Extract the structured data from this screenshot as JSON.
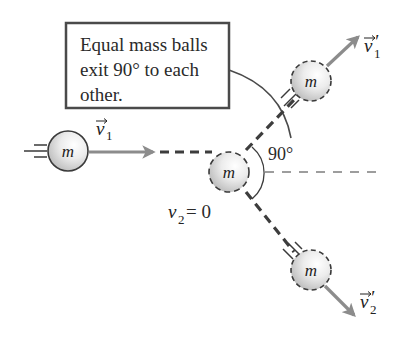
{
  "callout": {
    "lines": [
      "Equal mass balls",
      "exit 90° to each",
      "other."
    ]
  },
  "balls": {
    "incoming": {
      "label": "m"
    },
    "target": {
      "label": "m"
    },
    "exit_upper": {
      "label": "m"
    },
    "exit_lower": {
      "label": "m"
    }
  },
  "labels": {
    "v1_symbol": "v",
    "v1_sub": "1",
    "v1p_symbol": "v",
    "v1p_sub": "1",
    "v1p_prime": "′",
    "v2p_symbol": "v",
    "v2p_sub": "2",
    "v2p_prime": "′",
    "v2_symbol": "v",
    "v2_sub": "2",
    "v2_eq": " = 0",
    "angle": "90°"
  },
  "colors": {
    "arrow": "#8c8c8c",
    "outline": "#3a3a3a",
    "path_dash": "#3d3d3d",
    "ball_light": "#fafafa",
    "ball_dark": "#bdbdbd"
  }
}
